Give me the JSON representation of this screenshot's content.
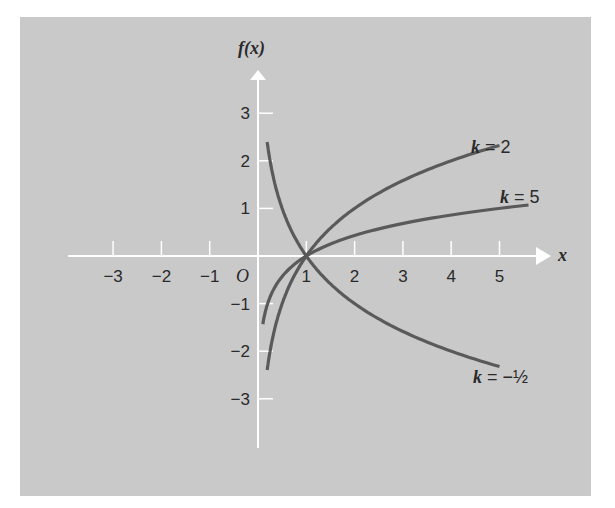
{
  "chart_data": {
    "type": "line",
    "title": "",
    "xlabel": "x",
    "ylabel": "f(x)",
    "origin_label": "O",
    "xlim": [
      -3.9,
      5.9
    ],
    "ylim": [
      -4.0,
      4.0
    ],
    "x_ticks": [
      -3,
      -2,
      -1,
      1,
      2,
      3,
      4,
      5
    ],
    "x_tick_labels": [
      "−3",
      "−2",
      "−1",
      "1",
      "2",
      "3",
      "4",
      "5"
    ],
    "y_ticks": [
      3,
      2,
      1,
      -1,
      -2,
      -3
    ],
    "y_tick_labels": [
      "3",
      "2",
      "1",
      "−1",
      "−2",
      "−3"
    ],
    "grid": false,
    "colors": {
      "background": "#c9c9c9",
      "axes": "#ffffff",
      "curve": "#5a5a5a",
      "text": "#2a2a2a"
    },
    "series": [
      {
        "name": "k = 2",
        "label_k": "k",
        "label_value": "2",
        "base": 2,
        "x": [
          0.19,
          0.25,
          0.35,
          0.5,
          0.7,
          1,
          1.5,
          2,
          2.5,
          3,
          3.5,
          4,
          4.5,
          5
        ],
        "y": [
          -2.4,
          -2.0,
          -1.51,
          -1.0,
          -0.51,
          0.0,
          0.58,
          1.0,
          1.32,
          1.58,
          1.81,
          2.0,
          2.17,
          2.32
        ]
      },
      {
        "name": "k = 5",
        "label_k": "k",
        "label_value": "5",
        "base": 5,
        "x": [
          0.1,
          0.15,
          0.25,
          0.4,
          0.6,
          1,
          1.5,
          2,
          2.5,
          3,
          3.5,
          4,
          4.5,
          5,
          5.6
        ],
        "y": [
          -1.43,
          -1.18,
          -0.86,
          -0.57,
          -0.32,
          0.0,
          0.25,
          0.43,
          0.57,
          0.68,
          0.78,
          0.86,
          0.93,
          1.0,
          1.07
        ]
      },
      {
        "name": "k = −½",
        "label_k": "k",
        "label_value": "−½",
        "base": 0.5,
        "x": [
          0.19,
          0.25,
          0.35,
          0.5,
          0.7,
          1,
          1.5,
          2,
          2.5,
          3,
          3.5,
          4,
          4.5,
          5
        ],
        "y": [
          2.4,
          2.0,
          1.51,
          1.0,
          0.51,
          0.0,
          -0.58,
          -1.0,
          -1.32,
          -1.58,
          -1.81,
          -2.0,
          -2.17,
          -2.32
        ]
      }
    ]
  }
}
